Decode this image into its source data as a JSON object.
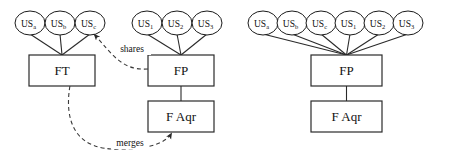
{
  "diagram": {
    "type": "node-link-diagram",
    "panels": [
      {
        "id": "panel-left",
        "name": "before-merge",
        "ellipses": [
          {
            "id": "l-us-a",
            "base": "US",
            "sub": "a",
            "cx": 30,
            "cy": 23,
            "rx": 15,
            "ry": 12
          },
          {
            "id": "l-us-b",
            "base": "US",
            "sub": "b",
            "cx": 60,
            "cy": 23,
            "rx": 15,
            "ry": 12
          },
          {
            "id": "l-us-c",
            "base": "US",
            "sub": "c",
            "cx": 90,
            "cy": 23,
            "rx": 15,
            "ry": 12
          },
          {
            "id": "l-us-1",
            "base": "US",
            "sub": "1",
            "cx": 147,
            "cy": 23,
            "rx": 15,
            "ry": 12
          },
          {
            "id": "l-us-2",
            "base": "US",
            "sub": "2",
            "cx": 177,
            "cy": 23,
            "rx": 15,
            "ry": 12
          },
          {
            "id": "l-us-3",
            "base": "US",
            "sub": "3",
            "cx": 207,
            "cy": 23,
            "rx": 15,
            "ry": 12
          }
        ],
        "boxes": [
          {
            "id": "l-ft",
            "label": "FT",
            "x": 29,
            "y": 55,
            "w": 66,
            "h": 31
          },
          {
            "id": "l-fp",
            "label": "FP",
            "x": 148,
            "y": 55,
            "w": 66,
            "h": 31
          },
          {
            "id": "l-faqr",
            "label": "F Aqr",
            "x": 148,
            "y": 101,
            "w": 66,
            "h": 31
          }
        ],
        "solid_edges": [
          {
            "from": "l-us-a",
            "to": "l-ft"
          },
          {
            "from": "l-us-b",
            "to": "l-ft"
          },
          {
            "from": "l-us-c",
            "to": "l-ft"
          },
          {
            "from": "l-us-1",
            "to": "l-fp"
          },
          {
            "from": "l-us-2",
            "to": "l-fp"
          },
          {
            "from": "l-us-3",
            "to": "l-fp"
          },
          {
            "from": "l-fp",
            "to": "l-faqr"
          }
        ],
        "dashed_edges": [
          {
            "id": "edge-shares",
            "label": "shares",
            "from": "l-fp",
            "to": "l-us-c",
            "label_x": 132,
            "label_y": 52
          },
          {
            "id": "edge-merges",
            "label": "merges",
            "from": "l-ft",
            "to": "l-faqr",
            "label_x": 130,
            "label_y": 146
          }
        ]
      },
      {
        "id": "panel-right",
        "name": "after-merge",
        "ellipses": [
          {
            "id": "r-us-a",
            "base": "US",
            "sub": "a",
            "cx": 263,
            "cy": 23,
            "rx": 15,
            "ry": 12
          },
          {
            "id": "r-us-b",
            "base": "US",
            "sub": "b",
            "cx": 292,
            "cy": 23,
            "rx": 15,
            "ry": 12
          },
          {
            "id": "r-us-c",
            "base": "US",
            "sub": "c",
            "cx": 321,
            "cy": 23,
            "rx": 15,
            "ry": 12
          },
          {
            "id": "r-us-1",
            "base": "US",
            "sub": "1",
            "cx": 350,
            "cy": 23,
            "rx": 15,
            "ry": 12
          },
          {
            "id": "r-us-2",
            "base": "US",
            "sub": "2",
            "cx": 379,
            "cy": 23,
            "rx": 15,
            "ry": 12
          },
          {
            "id": "r-us-3",
            "base": "US",
            "sub": "3",
            "cx": 408,
            "cy": 23,
            "rx": 15,
            "ry": 12
          }
        ],
        "boxes": [
          {
            "id": "r-fp",
            "label": "FP",
            "x": 311,
            "y": 55,
            "w": 71,
            "h": 31
          },
          {
            "id": "r-faqr",
            "label": "F Aqr",
            "x": 311,
            "y": 101,
            "w": 71,
            "h": 31
          }
        ],
        "solid_edges": [
          {
            "from": "r-us-a",
            "to": "r-fp"
          },
          {
            "from": "r-us-b",
            "to": "r-fp"
          },
          {
            "from": "r-us-c",
            "to": "r-fp"
          },
          {
            "from": "r-us-1",
            "to": "r-fp"
          },
          {
            "from": "r-us-2",
            "to": "r-fp"
          },
          {
            "from": "r-us-3",
            "to": "r-fp"
          },
          {
            "from": "r-fp",
            "to": "r-faqr"
          }
        ],
        "dashed_edges": []
      }
    ],
    "colors": {
      "stroke": "#2a2a2a",
      "ellipse_stroke": "#1a1a1a",
      "dashed_stroke": "#3a3a3a",
      "text": "#111111",
      "background": "#ffffff"
    }
  }
}
